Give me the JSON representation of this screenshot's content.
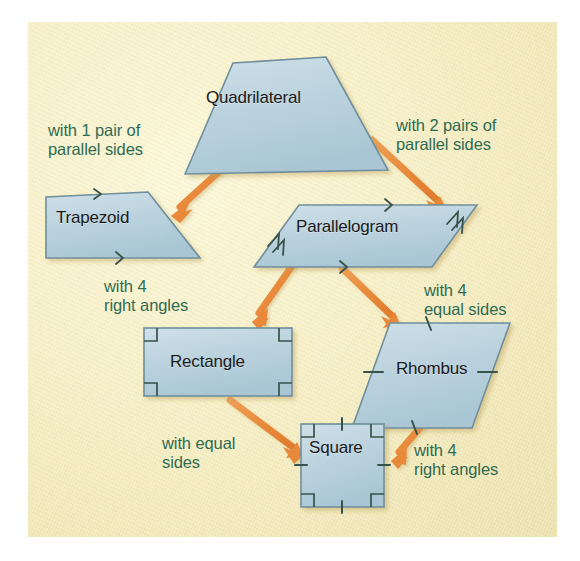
{
  "diagram": {
    "background_color": "#f4ecc0",
    "shape_fill": "#bdd4df",
    "shape_stroke": "#6f8f9c",
    "arrow_color": "#e8883a",
    "label_color": "#2f6b52",
    "shape_text_color": "#1a1a1a"
  },
  "shapes": [
    {
      "id": "quadrilateral",
      "name": "Quadrilateral",
      "label": "Quadrilateral",
      "marks": "none"
    },
    {
      "id": "trapezoid",
      "name": "Trapezoid",
      "label": "Trapezoid",
      "marks": "one-pair-parallel-arrows"
    },
    {
      "id": "parallelogram",
      "name": "Parallelogram",
      "label": "Parallelogram",
      "marks": "two-pairs-parallel-arrows"
    },
    {
      "id": "rectangle",
      "name": "Rectangle",
      "label": "Rectangle",
      "marks": "four-right-angles"
    },
    {
      "id": "rhombus",
      "name": "Rhombus",
      "label": "Rhombus",
      "marks": "four-equal-side-ticks"
    },
    {
      "id": "square",
      "name": "Square",
      "label": "Square",
      "marks": "four-right-angles-and-four-equal-side-ticks"
    }
  ],
  "edges": [
    {
      "id": "quad-to-trapezoid",
      "from": "Quadrilateral",
      "to": "Trapezoid",
      "label_line1": "with 1 pair of",
      "label_line2": "parallel sides"
    },
    {
      "id": "quad-to-parallelogram",
      "from": "Quadrilateral",
      "to": "Parallelogram",
      "label_line1": "with 2 pairs of",
      "label_line2": "parallel sides"
    },
    {
      "id": "parallelogram-to-rectangle",
      "from": "Parallelogram",
      "to": "Rectangle",
      "label_line1": "with 4",
      "label_line2": "right angles"
    },
    {
      "id": "parallelogram-to-rhombus",
      "from": "Parallelogram",
      "to": "Rhombus",
      "label_line1": "with 4",
      "label_line2": "equal sides"
    },
    {
      "id": "rectangle-to-square",
      "from": "Rectangle",
      "to": "Square",
      "label_line1": "with equal",
      "label_line2": "sides"
    },
    {
      "id": "rhombus-to-square",
      "from": "Rhombus",
      "to": "Square",
      "label_line1": "with 4",
      "label_line2": "right angles"
    }
  ]
}
